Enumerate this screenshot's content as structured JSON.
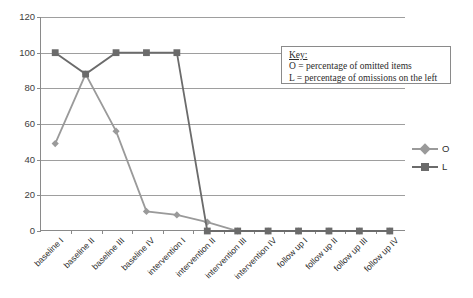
{
  "chart_data": {
    "type": "line",
    "title": "",
    "xlabel": "",
    "ylabel": "",
    "ylim": [
      0,
      120
    ],
    "yticks": [
      0,
      20,
      40,
      60,
      80,
      100,
      120
    ],
    "grid": true,
    "legend_position": "right",
    "categories": [
      "baseline I",
      "baseline II",
      "baseline III",
      "baseline IV",
      "intervention I",
      "intervention II",
      "intervention III",
      "intervention IV",
      "follow up I",
      "follow up II",
      "follow up III",
      "follow up IV"
    ],
    "series": [
      {
        "name": "O",
        "marker": "diamond",
        "color": "#9a9a9a",
        "values": [
          49,
          88,
          56,
          11,
          9,
          5,
          0,
          0,
          0,
          0,
          0,
          0
        ]
      },
      {
        "name": "L",
        "marker": "square",
        "color": "#6b6b6b",
        "values": [
          100,
          88,
          100,
          100,
          100,
          0,
          0,
          0,
          0,
          0,
          0,
          0
        ]
      }
    ]
  },
  "key": {
    "title": "Key:",
    "lines": [
      "O = percentage of omitted items",
      "L = percentage of omissions on the left"
    ]
  },
  "legend": {
    "items": [
      {
        "label": "O"
      },
      {
        "label": "L"
      }
    ]
  },
  "colors": {
    "series_o": "#9a9a9a",
    "series_l": "#6b6b6b",
    "axis": "#8a8a8a",
    "grid": "#9e9e9e",
    "text": "#2e2e2e"
  }
}
